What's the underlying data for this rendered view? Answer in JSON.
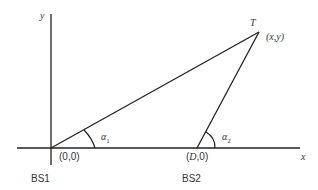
{
  "diagram": {
    "axes": {
      "x_label": "x",
      "y_label": "y"
    },
    "points": {
      "origin": {
        "label": "(0,0)",
        "name": "BS1"
      },
      "bs2": {
        "label": "(D,0)",
        "name": "BS2"
      },
      "target": {
        "letter": "T",
        "label": "(x,y)"
      }
    },
    "angles": {
      "alpha1": {
        "symbol": "α",
        "sub": "1"
      },
      "alpha2": {
        "symbol": "α",
        "sub": "2"
      }
    },
    "colors": {
      "line": "#222222",
      "text": "#333333"
    }
  }
}
